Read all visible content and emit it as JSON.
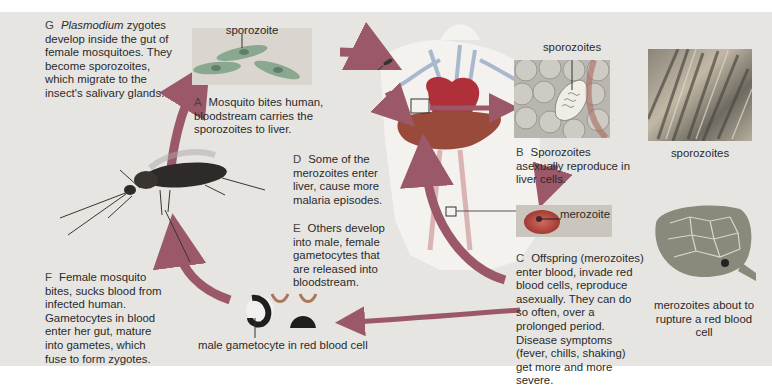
{
  "diagram": {
    "title_implicit": "Plasmodium life cycle (malaria)",
    "steps": {
      "A": {
        "letter": "A",
        "text": "Mosquito bites human, bloodstream carries the sporozoites to liver."
      },
      "B": {
        "letter": "B",
        "text": "Sporozoites asexually reproduce in liver cells."
      },
      "C": {
        "letter": "C",
        "text": "Offspring (merozoites) enter blood, invade red blood cells, reproduce asexually. They can do so often, over a prolonged period. Disease symptoms (fever, chills, shaking) get more and more severe."
      },
      "D": {
        "letter": "D",
        "text": "Some of the merozoites enter liver, cause more malaria episodes."
      },
      "E": {
        "letter": "E",
        "text": "Others develop into male, female gametocytes that are released into bloodstream."
      },
      "F": {
        "letter": "F",
        "text": "Female mosquito bites, sucks blood from infected human. Gametocytes in blood enter her gut, mature into gametes, which fuse to form zygotes."
      },
      "G": {
        "letter": "G",
        "italic": "Plasmodium",
        "text": " zygotes develop inside the gut of female mosquitoes. They become sporozoites, which migrate to the insect's salivary glands."
      }
    },
    "labels": {
      "sporozoite": "sporozoite",
      "sporozoites_liver": "sporozoites",
      "sporozoites_micrograph": "sporozoites",
      "merozoite": "merozoite",
      "merozoites_rupture": "merozoites about to rupture a red blood cell",
      "male_gametocyte": "male gametocyte in red blood cell"
    },
    "colors": {
      "background": "#e6e5e2",
      "arrow": "#9a5868",
      "heart": "#b0303a",
      "liver": "#9a4a3a",
      "sporozoite_cell": "#6aa08a",
      "red_blood_cell": "#b8483e"
    }
  }
}
